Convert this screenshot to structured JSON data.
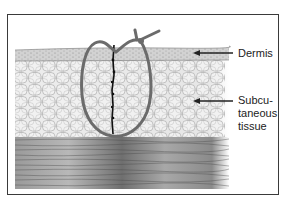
{
  "figure": {
    "labels": {
      "dermis": "Dermis",
      "subcutaneous_line1": "Subcu-",
      "subcutaneous_line2": "taneous",
      "subcutaneous_line3": "tissue"
    },
    "colors": {
      "frame": "#3a3a3a",
      "suture": "#6b6b6b",
      "incision": "#111111",
      "dermis": "#cfcfcf",
      "fat": "#e9e9e9",
      "fat_cell_outline": "#9a9a9a",
      "muscle": "#8c8c8c",
      "arrow": "#222222"
    }
  }
}
